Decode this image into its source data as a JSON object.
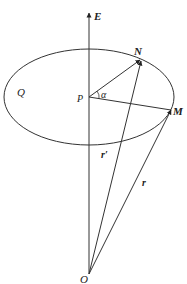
{
  "diagram": {
    "type": "geometry-vector-diagram",
    "labels": {
      "axis": "E",
      "plane": "Q",
      "center": "P",
      "point_n": "N",
      "point_m": "M",
      "origin": "O",
      "angle": "α",
      "vector_r_prime": "r′",
      "vector_r": "r"
    },
    "colors": {
      "stroke": "#333333",
      "text": "#222222",
      "background": "#ffffff"
    }
  }
}
